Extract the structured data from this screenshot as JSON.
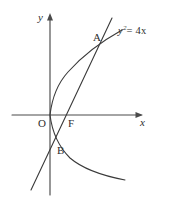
{
  "figure": {
    "kind": "analytic-geometry-diagram",
    "background_color": "#ffffff",
    "stroke_color": "#3a3a3a",
    "axis_color": "#4a4a4a",
    "text_color": "#2e2e2e"
  },
  "axes": {
    "x_axis_label": "x",
    "y_axis_label": "y",
    "x_axis": {
      "x1": 12,
      "y1": 115,
      "x2": 143,
      "y2": 115,
      "arrow": "right"
    },
    "y_axis": {
      "x1": 50,
      "y1": 195,
      "x2": 50,
      "y2": 14,
      "arrow": "up"
    }
  },
  "labels": {
    "origin": "O",
    "focus": "F",
    "point_upper": "A",
    "point_lower": "B",
    "equation_var": "y",
    "equation_exponent": "2",
    "equation_rhs": "= 4x"
  },
  "chart_data": {
    "type": "line",
    "title": "",
    "xlabel": "x",
    "ylabel": "y",
    "curves": [
      {
        "name": "parabola",
        "equation": "y^2 = 4x",
        "path": "M 122 30 C 104 40 84 54 68 72 C 58 83 52 98 50 115 C 52 131 58 146 70 158 C 84 170 104 176 125 180"
      },
      {
        "name": "focal-chord",
        "equation": "line through focus F",
        "path": "M 112 18 L 31 190"
      }
    ],
    "points": [
      {
        "name": "O",
        "label": "O",
        "x": 50,
        "y": 115,
        "role": "origin"
      },
      {
        "name": "F",
        "label": "F",
        "x": 67,
        "y": 115,
        "role": "focus"
      },
      {
        "name": "A",
        "label": "A",
        "x": 100,
        "y": 43,
        "role": "upper-intersection"
      },
      {
        "name": "B",
        "label": "B",
        "x": 55,
        "y": 142,
        "role": "lower-intersection"
      }
    ],
    "legend": [],
    "grid": false
  }
}
